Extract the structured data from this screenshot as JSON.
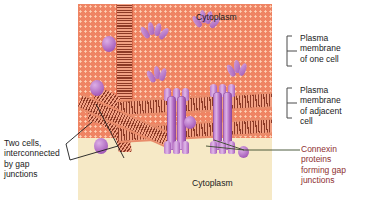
{
  "figure": {
    "labels": {
      "cytoplasm_top": "Cytoplasm",
      "cytoplasm_bottom": "Cytoplasm",
      "plasma_membrane_one_cell": "Plasma\nmembrane\nof one cell",
      "plasma_membrane_adjacent_cell": "Plasma\nmembrane\nof adjacent\ncell",
      "connexin": "Connexin\nproteins\nforming gap\njunctions",
      "two_cells": "Two cells,\ninterconnected\nby gap\njunctions"
    },
    "colors": {
      "cytoplasm_top": "#ef8463",
      "cytoplasm_bottom": "#f6e9c6",
      "membrane_dark": "#8d3a26",
      "membrane_light": "#f2a184",
      "connexin_protein": "#b873c4",
      "connexin_label_text": "#8e2f2f",
      "label_text": "#1b1b1b",
      "leader_line": "#1b1b1b",
      "bracket": "#4a4a4a",
      "background": "#ffffff"
    }
  }
}
